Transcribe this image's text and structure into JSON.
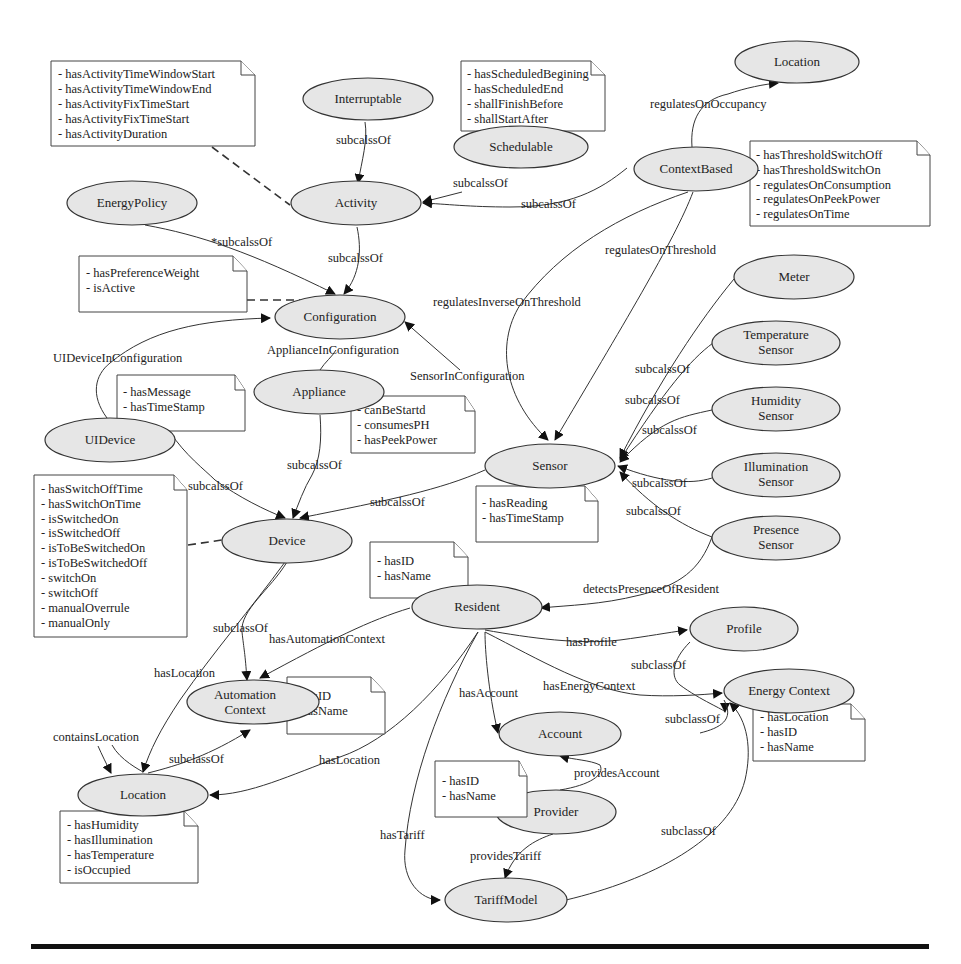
{
  "diagram": {
    "nodes": {
      "location_top": {
        "label": "Location"
      },
      "interruptable": {
        "label": "Interruptable"
      },
      "schedulable": {
        "label": "Schedulable"
      },
      "context_based": {
        "label": "ContextBased"
      },
      "activity": {
        "label": "Activity"
      },
      "energy_policy": {
        "label": "EnergyPolicy"
      },
      "configuration": {
        "label": "Configuration"
      },
      "appliance": {
        "label": "Appliance"
      },
      "ui_device": {
        "label": "UIDevice"
      },
      "sensor": {
        "label": "Sensor"
      },
      "meter": {
        "label": "Meter"
      },
      "temperature_sensor": {
        "line1": "Temperature",
        "line2": "Sensor"
      },
      "humidity_sensor": {
        "line1": "Humidity",
        "line2": "Sensor"
      },
      "illumination_sensor": {
        "line1": "Illumination",
        "line2": "Sensor"
      },
      "presence_sensor": {
        "line1": "Presence",
        "line2": "Sensor"
      },
      "device": {
        "label": "Device"
      },
      "resident": {
        "label": "Resident"
      },
      "profile": {
        "label": "Profile"
      },
      "automation_context": {
        "line1": "Automation",
        "line2": "Context"
      },
      "energy_context": {
        "label": "Energy Context"
      },
      "account": {
        "label": "Account"
      },
      "location_bottom": {
        "label": "Location"
      },
      "provider": {
        "label": "Provider"
      },
      "tariff_model": {
        "label": "TariffModel"
      }
    },
    "notes": {
      "activity_props": [
        "- hasActivityTimeWindowStart",
        "- hasActivityTimeWindowEnd",
        "- hasActivityFixTimeStart",
        "- hasActivityFixTimeStart",
        "- hasActivityDuration"
      ],
      "schedulable_props": [
        "- hasScheduledBegining",
        "- hasScheduledEnd",
        "- shallFinishBefore",
        "- shallStartAfter"
      ],
      "context_based_props": [
        "- hasThresholdSwitchOff",
        "- hasThresholdSwitchOn",
        "- regulatesOnConsumption",
        "- regulatesOnPeekPower",
        "- regulatesOnTime"
      ],
      "configuration_props": [
        "- hasPreferenceWeight",
        "- isActive"
      ],
      "ui_device_props": [
        "- hasMessage",
        "- hasTimeStamp"
      ],
      "appliance_props": [
        "- canBeStartd",
        "- consumesPH",
        "- hasPeekPower"
      ],
      "device_props": [
        "- hasSwitchOffTime",
        "- hasSwitchOnTime",
        "- isSwitchedOn",
        "- isSwitchedOff",
        "- isToBeSwitchedOn",
        "- isToBeSwitchedOff",
        "- switchOn",
        "- switchOff",
        "- manualOverrule",
        "- manualOnly"
      ],
      "sensor_props": [
        "- hasReading",
        "- hasTimeStamp"
      ],
      "resident_props": [
        "- hasID",
        "- hasName"
      ],
      "automation_context_props": [
        "- hasID",
        "- hasName"
      ],
      "energy_context_props": [
        "- hasLocation",
        "- hasID",
        "- hasName"
      ],
      "provider_props": [
        "- hasID",
        "- hasName"
      ],
      "location_props": [
        "- hasHumidity",
        "- hasIllumination",
        "- hasTemperature",
        "- isOccupied"
      ]
    },
    "edge_labels": {
      "interruptable_activity": "subcalssOf",
      "schedulable_activity": "subcalssOf",
      "context_activity": "subcalssOf",
      "context_location": "regulatesOnOccupancy",
      "context_threshold": "regulatesOnThreshold",
      "context_inverse": "regulatesInverseOnThreshold",
      "energypolicy_config": "*subcalssOf",
      "activity_config": "subcalssOf",
      "uidevice_config": "UIDeviceInConfiguration",
      "appliance_config": "ApplianceInConfiguration",
      "sensor_config": "SensorInConfiguration",
      "appliance_device": "subcalssOf",
      "uidevice_device": "subcalssOf",
      "sensor_device": "subcalssOf",
      "meter_sensor": "subcalssOf",
      "temp_sensor": "subcalssOf",
      "humidity_sensor": "subcalssOf",
      "illum_sensor": "subcalssOf",
      "presence_sensor": "subcalssOf",
      "presence_resident": "detectsPresenceOfResident",
      "resident_profile": "hasProfile",
      "profile_energy": "subclassOf",
      "resident_energy": "hasEnergyContext",
      "account_energy": "subclassOf",
      "resident_account": "hasAccount",
      "device_automation": "subclassOf",
      "resident_automation": "hasAutomationContext",
      "device_location": "hasLocation",
      "location_contains": "containsLocation",
      "location_automation": "subclassOf",
      "resident_location": "hasLocation",
      "provider_account": "providesAccount",
      "resident_tariff": "hasTariff",
      "provider_tariff": "providesTariff",
      "tariff_energy": "subclassOf"
    }
  }
}
